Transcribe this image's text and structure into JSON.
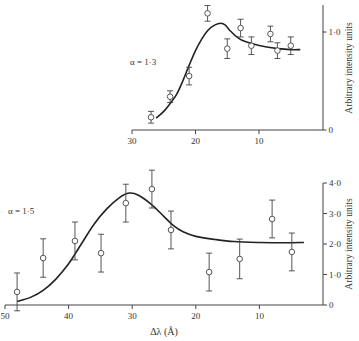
{
  "chart_data": [
    {
      "type": "scatter",
      "id": "top",
      "annotation": "α = 1·3",
      "xlabel": "",
      "ylabel": "Arbitrary intensity units",
      "xlim": [
        30,
        0
      ],
      "ylim": [
        0,
        1.25
      ],
      "x_ticks": [
        30,
        20,
        10
      ],
      "x_tick_labels": [
        "30",
        "20",
        "10"
      ],
      "y_ticks": [
        0,
        1.0
      ],
      "y_tick_labels": [
        "0",
        "1·0"
      ],
      "points": [
        {
          "x": 27.0,
          "y": 0.13,
          "err": 0.06
        },
        {
          "x": 24.0,
          "y": 0.34,
          "err": 0.06
        },
        {
          "x": 21.0,
          "y": 0.55,
          "err": 0.09
        },
        {
          "x": 18.1,
          "y": 1.19,
          "err": 0.08
        },
        {
          "x": 15.0,
          "y": 0.83,
          "err": 0.1
        },
        {
          "x": 12.9,
          "y": 1.04,
          "err": 0.09
        },
        {
          "x": 11.2,
          "y": 0.86,
          "err": 0.09
        },
        {
          "x": 8.2,
          "y": 0.98,
          "err": 0.08
        },
        {
          "x": 7.1,
          "y": 0.81,
          "err": 0.08
        },
        {
          "x": 5.0,
          "y": 0.86,
          "err": 0.09
        }
      ],
      "curve": [
        [
          26.2,
          0.12
        ],
        [
          25.0,
          0.19
        ],
        [
          24.0,
          0.27
        ],
        [
          23.0,
          0.36
        ],
        [
          22.0,
          0.5
        ],
        [
          21.0,
          0.66
        ],
        [
          20.0,
          0.81
        ],
        [
          19.0,
          0.93
        ],
        [
          18.0,
          1.02
        ],
        [
          17.0,
          1.07
        ],
        [
          16.0,
          1.09
        ],
        [
          15.3,
          1.07
        ],
        [
          14.5,
          1.01
        ],
        [
          13.5,
          0.95
        ],
        [
          12.5,
          0.91
        ],
        [
          11.0,
          0.88
        ],
        [
          9.0,
          0.85
        ],
        [
          7.0,
          0.83
        ],
        [
          5.0,
          0.82
        ],
        [
          3.5,
          0.82
        ]
      ]
    },
    {
      "type": "scatter",
      "id": "bottom",
      "annotation": "α = 1·5",
      "xlabel": "Δλ (Å)",
      "ylabel": "Arbitrary intensity units",
      "xlim": [
        50,
        0
      ],
      "ylim": [
        0,
        4.0
      ],
      "x_ticks": [
        50,
        40,
        30,
        20,
        10
      ],
      "x_tick_labels": [
        "50",
        "40",
        "30",
        "20",
        "10"
      ],
      "y_ticks": [
        0,
        1.0,
        2.0,
        3.0,
        4.0
      ],
      "y_tick_labels": [
        "0",
        "1·0",
        "2·0",
        "3·0",
        "4·0"
      ],
      "points": [
        {
          "x": 48.1,
          "y": 0.43,
          "err": 0.62
        },
        {
          "x": 44.0,
          "y": 1.54,
          "err": 0.63
        },
        {
          "x": 39.0,
          "y": 2.1,
          "err": 0.62
        },
        {
          "x": 34.9,
          "y": 1.7,
          "err": 0.62
        },
        {
          "x": 31.0,
          "y": 3.34,
          "err": 0.62
        },
        {
          "x": 26.9,
          "y": 3.8,
          "err": 0.62
        },
        {
          "x": 23.9,
          "y": 2.46,
          "err": 0.62
        },
        {
          "x": 17.9,
          "y": 1.08,
          "err": 0.62
        },
        {
          "x": 13.1,
          "y": 1.51,
          "err": 0.65
        },
        {
          "x": 8.0,
          "y": 2.82,
          "err": 0.62
        },
        {
          "x": 4.9,
          "y": 1.74,
          "err": 0.62
        }
      ],
      "curve": [
        [
          48.1,
          0.12
        ],
        [
          46.0,
          0.25
        ],
        [
          44.0,
          0.48
        ],
        [
          42.0,
          0.85
        ],
        [
          40.0,
          1.35
        ],
        [
          38.0,
          2.0
        ],
        [
          36.0,
          2.65
        ],
        [
          34.0,
          3.15
        ],
        [
          32.0,
          3.52
        ],
        [
          30.5,
          3.67
        ],
        [
          29.0,
          3.6
        ],
        [
          27.0,
          3.3
        ],
        [
          25.0,
          2.9
        ],
        [
          23.5,
          2.6
        ],
        [
          22.0,
          2.4
        ],
        [
          20.0,
          2.25
        ],
        [
          17.0,
          2.15
        ],
        [
          14.0,
          2.08
        ],
        [
          10.0,
          2.05
        ],
        [
          6.0,
          2.04
        ],
        [
          3.0,
          2.05
        ]
      ]
    }
  ]
}
